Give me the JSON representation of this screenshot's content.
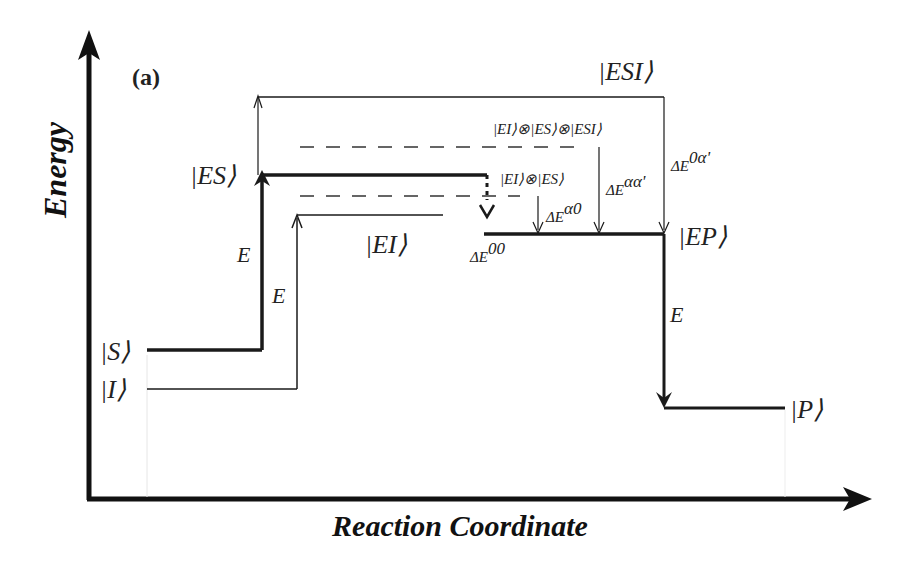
{
  "diagram": {
    "panel_label": "(a)",
    "axes": {
      "y_label": "Energy",
      "x_label": "Reaction Coordinate"
    },
    "states": {
      "S": "|S⟩",
      "I": "|I⟩",
      "ES": "|ES⟩",
      "EI": "|EI⟩",
      "ESI": "|ESI⟩",
      "EP": "|EP⟩",
      "P": "|P⟩"
    },
    "superpositions": {
      "EI_ES": "|EI⟩⊗|ES⟩",
      "EI_ES_ESI": "|EI⟩⊗|ES⟩⊗|ESI⟩"
    },
    "transitions": {
      "E_S_to_ES": "E",
      "E_I_to_EI": "E",
      "E_EP_to_P": "E"
    },
    "energy_gaps": {
      "dE00": {
        "base": "ΔE",
        "sup": "00"
      },
      "dEa0": {
        "base": "ΔE",
        "sup": "α0"
      },
      "dEaa": {
        "base": "ΔE",
        "sup": "αα'"
      },
      "dE0a": {
        "base": "ΔE",
        "sup": "0α'"
      }
    },
    "colors": {
      "line": "#1a1a1a",
      "dashed": "#333333"
    }
  }
}
